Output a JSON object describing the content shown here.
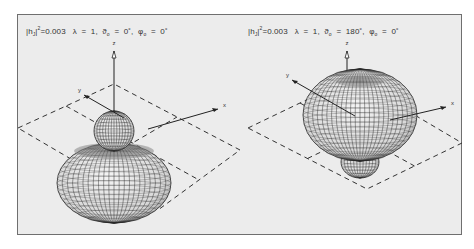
{
  "figure": {
    "panels": [
      {
        "id": "left",
        "caption": {
          "prefix": "|h",
          "sub": "J",
          "mid": "|",
          "sup": "2",
          "value": "=0.003",
          "params": "   λ  =  1,  ϑ",
          "theta_sub": "o",
          "theta_val": "  =  0˚,  φ",
          "phi_sub": "o",
          "phi_val": "  =  0˚"
        },
        "parameters": {
          "h_J_squared": 0.003,
          "lambda": 1,
          "theta_o_deg": 0,
          "phi_o_deg": 0
        },
        "lobes": {
          "major": "below",
          "minor": "above"
        },
        "axes": {
          "z": "z",
          "x": "x",
          "y": "y"
        }
      },
      {
        "id": "right",
        "caption": {
          "prefix": "|h",
          "sub": "J",
          "mid": "|",
          "sup": "2",
          "value": "=0.003",
          "params": "   λ  =  1,  ϑ",
          "theta_sub": "o",
          "theta_val": "  =  180˚,  φ",
          "phi_sub": "o",
          "phi_val": "  =  0˚"
        },
        "parameters": {
          "h_J_squared": 0.003,
          "lambda": 1,
          "theta_o_deg": 180,
          "phi_o_deg": 0
        },
        "lobes": {
          "major": "above",
          "minor": "below"
        },
        "axes": {
          "z": "z",
          "x": "x",
          "y": "y"
        }
      }
    ],
    "colors": {
      "background": "#ececec",
      "border": "#6f6f6f",
      "mesh": "#2a2a2a",
      "surface_light": "#d8d8d8",
      "surface_dark": "#6a6a6a",
      "dashed_plane": "#333333"
    }
  }
}
